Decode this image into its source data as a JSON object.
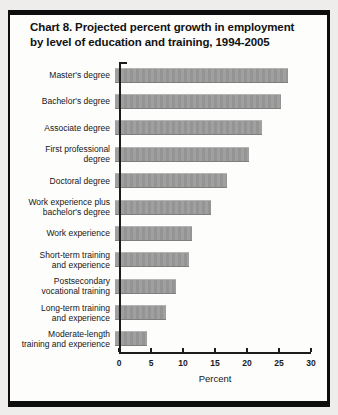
{
  "header": {
    "title_line1": "Chart 8. Projected percent growth in employment",
    "title_line2": "by level of education and training, 1994-2005"
  },
  "chart_data": {
    "type": "bar",
    "orientation": "horizontal",
    "title": "Chart 8. Projected percent growth in employment by level of education and training, 1994-2005",
    "xlabel": "Percent",
    "xlim": [
      0,
      30
    ],
    "x_ticks": [
      0,
      5,
      10,
      15,
      20,
      25,
      30
    ],
    "grid": false,
    "bar_color": "#9a9a9a",
    "categories": [
      "Master's degree",
      "Bachelor's degree",
      "Associate degree",
      "First professional degree",
      "Doctoral degree",
      "Work experience plus bachelor's degree",
      "Work experience",
      "Short-term training and experience",
      "Postsecondary vocational training",
      "Long-term training and experience",
      "Moderate-length training and experience"
    ],
    "labels_wrapped": [
      "Master's degree",
      "Bachelor's degree",
      "Associate degree",
      "First professional\ndegree",
      "Doctoral degree",
      "Work experience plus\nbachelor's degree",
      "Work experience",
      "Short-term training\nand experience",
      "Postsecondary\nvocational training",
      "Long-term training\nand experience",
      "Moderate-length\ntraining and experience"
    ],
    "values": [
      27,
      26,
      23,
      21,
      17.5,
      15,
      12,
      11.5,
      9.5,
      8,
      5
    ]
  }
}
